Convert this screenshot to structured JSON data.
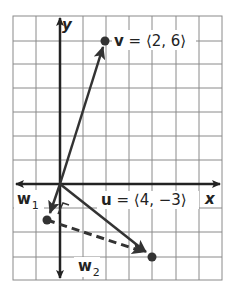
{
  "diagram": {
    "type": "vector-projection-on-coordinate-grid",
    "axes": {
      "x_label": "x",
      "y_label": "y"
    },
    "grid": {
      "x_lines_px": [
        13,
        36,
        60,
        83,
        106,
        129,
        152,
        176,
        199,
        222
      ],
      "y_lines_px": [
        16,
        41,
        64,
        88,
        112,
        136,
        160,
        184,
        208,
        232,
        257,
        280
      ],
      "origin_px": [
        60,
        184
      ]
    },
    "vectors": {
      "v": {
        "label_name": "v",
        "label_value": " = ⟨2, 6⟩",
        "components": [
          2,
          6
        ],
        "tip_px": [
          105,
          41
        ]
      },
      "u": {
        "label_name": "u",
        "label_value": " = ⟨4, −3⟩",
        "components": [
          4,
          -3
        ],
        "tip_px": [
          152,
          257
        ]
      },
      "w1": {
        "label_name": "w",
        "label_sub": "1",
        "tip_px": [
          47,
          220
        ]
      },
      "w2": {
        "label_name": "w",
        "label_sub": "2",
        "style": "dashed"
      }
    },
    "colors": {
      "grid": "#8a8a8a",
      "axis": "#222222",
      "vector": "#333333",
      "background": "#ffffff"
    }
  }
}
